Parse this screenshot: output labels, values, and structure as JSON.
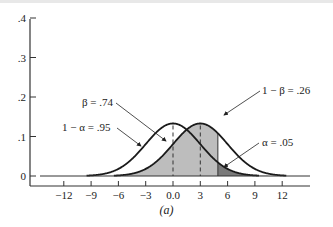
{
  "chart_data": {
    "type": "area",
    "title": "",
    "caption": "(a)",
    "xlabel": "",
    "ylabel": "",
    "xlim": [
      -15,
      15
    ],
    "ylim": [
      0,
      0.4
    ],
    "x_ticks": [
      "-12",
      "-9",
      "-6",
      "-3",
      "0.0",
      "3",
      "6",
      "9",
      "12"
    ],
    "x_tick_values": [
      -12,
      -9,
      -6,
      -3,
      0,
      3,
      6,
      9,
      12
    ],
    "y_ticks": [
      "0",
      ".1",
      ".2",
      ".3",
      ".4"
    ],
    "y_tick_values": [
      0,
      0.1,
      0.2,
      0.3,
      0.4
    ],
    "grid": false,
    "series": [
      {
        "name": "H0 distribution",
        "distribution": "normal",
        "mean": 0,
        "sd": 3,
        "fill": "none"
      },
      {
        "name": "H1 distribution",
        "distribution": "normal",
        "mean": 3,
        "sd": 3,
        "fill": "light gray (beta region)"
      }
    ],
    "critical_value": 4.93,
    "dashed_lines_at": [
      0,
      3
    ],
    "annotations": [
      {
        "label": "β = .74",
        "region": "H1 area left of critical value"
      },
      {
        "label": "1 − α = .95",
        "region": "H0 area left of critical value"
      },
      {
        "label": "1 − β = .26",
        "region": "H1 area right of critical value"
      },
      {
        "label": "α = .05",
        "region": "H0 tail right of critical value (dark)"
      }
    ],
    "colors": {
      "beta_fill": "#bdbdbd",
      "alpha_fill": "#7a7a7a",
      "curve": "#1a1a1a"
    }
  },
  "labels": {
    "beta": "β = .74",
    "one_minus_alpha": "1 − α = .95",
    "one_minus_beta": "1 − β = .26",
    "alpha": "α = .05",
    "caption": "(a)"
  },
  "axis": {
    "x": [
      "−12",
      "−9",
      "−6",
      "−3",
      "0.0",
      "3",
      "6",
      "9",
      "12"
    ],
    "y": [
      "0",
      ".1",
      ".2",
      ".3",
      ".4"
    ]
  }
}
